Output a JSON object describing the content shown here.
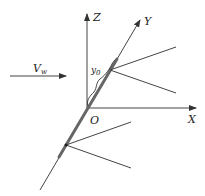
{
  "diagram": {
    "type": "3d-coordinate-schematic",
    "axes": {
      "z_label": "Z",
      "y_label": "Y",
      "x_label": "X",
      "origin_label": "O"
    },
    "wind": {
      "label_main": "V",
      "label_sub": "w"
    },
    "dimension": {
      "label_main": "y",
      "label_sub": "0"
    },
    "colors": {
      "line": "#444444",
      "rod": "#666666",
      "text": "#222222",
      "background": "#ffffff"
    }
  }
}
